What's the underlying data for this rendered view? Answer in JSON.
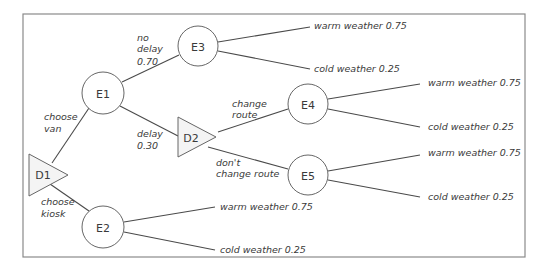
{
  "diagram": {
    "type": "decision-tree",
    "colors": {
      "frame": "#8a8a8a",
      "edge": "#4a4a4a",
      "decision_fill": "#f4f4f4",
      "chance_fill": "#ffffff",
      "text": "#3a3a3a"
    },
    "nodes": {
      "D1": {
        "label": "D1",
        "kind": "decision"
      },
      "E1": {
        "label": "E1",
        "kind": "chance"
      },
      "E2": {
        "label": "E2",
        "kind": "chance"
      },
      "E3": {
        "label": "E3",
        "kind": "chance"
      },
      "D2": {
        "label": "D2",
        "kind": "decision"
      },
      "E4": {
        "label": "E4",
        "kind": "chance"
      },
      "E5": {
        "label": "E5",
        "kind": "chance"
      }
    },
    "edges": {
      "d1_e1": {
        "line1": "choose",
        "line2": "van"
      },
      "d1_e2": {
        "line1": "choose",
        "line2": "kiosk"
      },
      "e1_e3": {
        "line1": "no",
        "line2": "delay",
        "line3": "0.70"
      },
      "e1_d2": {
        "line1": "delay",
        "line2": "0.30"
      },
      "d2_e4": {
        "line1": "change",
        "line2": "route"
      },
      "d2_e5": {
        "line1": "don't",
        "line2": "change route"
      }
    },
    "outcomes": {
      "e3_warm": "warm weather  0.75",
      "e3_cold": "cold weather  0.25",
      "e4_warm": "warm weather  0.75",
      "e4_cold": "cold weather  0.25",
      "e5_warm": "warm weather  0.75",
      "e5_cold": "cold weather  0.25",
      "e2_warm": "warm weather  0.75",
      "e2_cold": "cold weather  0.25"
    }
  }
}
